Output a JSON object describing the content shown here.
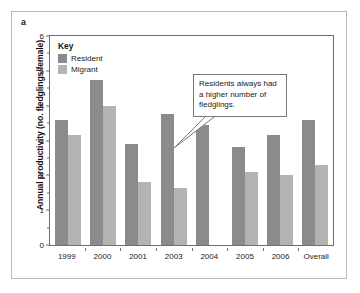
{
  "panel": {
    "label": "a"
  },
  "legend": {
    "title": "Key",
    "items": [
      {
        "label": "Resident",
        "color": "#8b8b8b",
        "swatch_name": "legend-swatch-resident"
      },
      {
        "label": "Migrant",
        "color": "#b3b3b3",
        "swatch_name": "legend-swatch-migrant"
      }
    ]
  },
  "annotation": {
    "text": "Residents always had a higher number of fledglings."
  },
  "axis": {
    "y_ticks": [
      "0",
      "1",
      "2",
      "3",
      "4",
      "5",
      "6"
    ]
  },
  "chart_data": {
    "type": "bar",
    "title": "",
    "xlabel": "",
    "ylabel": "Annual productivity (no. fledglings/female)",
    "ylim": [
      0,
      6
    ],
    "ytick_step": 1,
    "yminor_step": 0.5,
    "grid": false,
    "legend_position": "inside-top-left",
    "categories": [
      "1999",
      "2000",
      "2001",
      "2003",
      "2004",
      "2005",
      "2006",
      "Overall"
    ],
    "series": [
      {
        "name": "Resident",
        "color": "#8b8b8b",
        "values": [
          3.6,
          4.75,
          2.9,
          3.75,
          3.45,
          2.8,
          3.15,
          3.6
        ]
      },
      {
        "name": "Migrant",
        "color": "#b3b3b3",
        "values": [
          3.15,
          4.0,
          1.8,
          1.65,
          null,
          2.1,
          2.0,
          2.3
        ]
      }
    ]
  }
}
